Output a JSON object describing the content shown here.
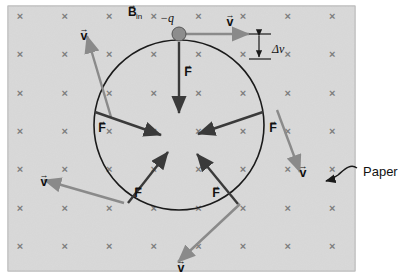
{
  "figure": {
    "title_alt": "Negative charge moving in a uniform magnetic field directed into the page",
    "panel": {
      "x": 8,
      "y": 6,
      "w": 347,
      "h": 265,
      "fill": "#d9d9d9",
      "border": "#9a9a9a",
      "field_symbol": "×",
      "field_symbol_name": "magnetic-field-into-page-x",
      "field_color": "#7d7d7d",
      "grid_cols": 8,
      "grid_rows": 7,
      "grid_x0": 20,
      "grid_y0": 20,
      "grid_dx": 44.6,
      "grid_dy": 38.3
    },
    "circle": {
      "cx": 179,
      "cy": 125,
      "r": 85,
      "stroke": "#1a1a1a",
      "stroke_width": 1.6
    },
    "particle": {
      "cx": 179,
      "cy": 34,
      "r": 7,
      "fill": "#8d8d8d",
      "stroke": "#555555",
      "label": "−q",
      "label_x": 160,
      "label_y": 22
    },
    "labels": {
      "b_field": "B",
      "b_field_sub": "in",
      "b_field_x": 128,
      "b_field_y": 16,
      "delta_v": "Δv",
      "delta_v_x": 272,
      "delta_v_y": 53,
      "paper": "Paper",
      "paper_x": 363,
      "paper_y": 176,
      "velocity": "v",
      "force": "F"
    },
    "velocity_color": "#8a8a8a",
    "force_color": "#3a3a3a",
    "velocity_vectors": [
      {
        "name": "velocity-top",
        "x1": 184,
        "y1": 34,
        "x2": 249,
        "y2": 34,
        "label_x": 230,
        "label_y": 26
      },
      {
        "name": "velocity-upper-left",
        "x1": 111,
        "y1": 117,
        "x2": 87,
        "y2": 36,
        "label_x": 84,
        "label_y": 40
      },
      {
        "name": "velocity-left",
        "x1": 124,
        "y1": 203,
        "x2": 44,
        "y2": 180,
        "label_x": 44,
        "label_y": 186
      },
      {
        "name": "velocity-right",
        "x1": 277,
        "y1": 110,
        "x2": 300,
        "y2": 172,
        "label_x": 303,
        "label_y": 177
      },
      {
        "name": "velocity-bottom",
        "x1": 240,
        "y1": 204,
        "x2": 178,
        "y2": 262,
        "label_x": 181,
        "label_y": 272
      }
    ],
    "force_vectors": [
      {
        "name": "force-top",
        "x1": 179,
        "y1": 42,
        "x2": 179,
        "y2": 113,
        "label_x": 188,
        "label_y": 76
      },
      {
        "name": "force-left",
        "x1": 95,
        "y1": 112,
        "x2": 161,
        "y2": 135,
        "label_x": 102,
        "label_y": 132
      },
      {
        "name": "force-right",
        "x1": 263,
        "y1": 112,
        "x2": 198,
        "y2": 134,
        "label_x": 273,
        "label_y": 132
      },
      {
        "name": "force-lower-left",
        "x1": 128,
        "y1": 203,
        "x2": 168,
        "y2": 152,
        "label_x": 138,
        "label_y": 197
      },
      {
        "name": "force-lower-right",
        "x1": 238,
        "y1": 204,
        "x2": 197,
        "y2": 154,
        "label_x": 216,
        "label_y": 197
      }
    ],
    "delta_v_marker": {
      "name": "delta-v-bracket",
      "top_tick_x1": 249,
      "top_tick_x2": 271,
      "top_tick_y": 34,
      "bot_tick_x1": 249,
      "bot_tick_x2": 271,
      "bot_tick_y": 59,
      "arrow_x": 259,
      "arrow_y1": 36,
      "arrow_y2": 57
    },
    "paper_pointer": {
      "name": "paper-callout-arrow",
      "path": "M 357,168 C 350,163 344,170 338,175 C 334,178 330,180 326,181",
      "tip_x": 320,
      "tip_y": 183
    }
  }
}
